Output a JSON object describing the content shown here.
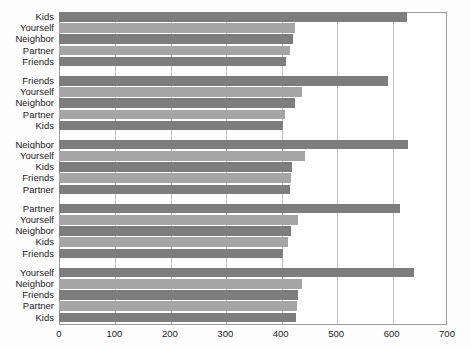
{
  "chart_data": {
    "type": "bar",
    "orientation": "horizontal",
    "title": "",
    "xlabel": "",
    "ylabel": "",
    "xlim": [
      0,
      700
    ],
    "xticks": [
      0,
      100,
      200,
      300,
      400,
      500,
      600,
      700
    ],
    "grid": true,
    "legend": "none",
    "groups": [
      {
        "name": "group-1",
        "categories": [
          "Kids",
          "Yourself",
          "Neighbor",
          "Partner",
          "Friends"
        ],
        "values": [
          627,
          426,
          422,
          416,
          410
        ]
      },
      {
        "name": "group-2",
        "categories": [
          "Friends",
          "Yourself",
          "Neighbor",
          "Partner",
          "Kids"
        ],
        "values": [
          594,
          439,
          425,
          408,
          405
        ]
      },
      {
        "name": "group-3",
        "categories": [
          "Neighbor",
          "Yourself",
          "Kids",
          "Friends",
          "Partner"
        ],
        "values": [
          629,
          443,
          420,
          418,
          416
        ]
      },
      {
        "name": "group-4",
        "categories": [
          "Partner",
          "Yourself",
          "Neighbor",
          "Kids",
          "Friends"
        ],
        "values": [
          615,
          432,
          418,
          414,
          405
        ]
      },
      {
        "name": "group-5",
        "categories": [
          "Yourself",
          "Neighbor",
          "Friends",
          "Partner",
          "Kids"
        ],
        "values": [
          640,
          438,
          432,
          430,
          428
        ]
      }
    ],
    "colors": {
      "bar_dark": "#7d7d7d",
      "bar_light": "#a5a5a5",
      "gridline": "#c3c3c3",
      "frame": "#9a9a9a",
      "background": "#ffffff",
      "text": "#1a1a1a"
    }
  }
}
